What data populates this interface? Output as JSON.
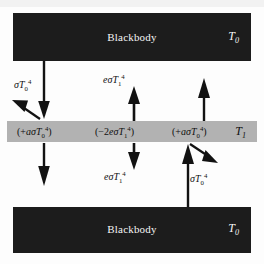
{
  "figure": {
    "type": "physics-diagram",
    "colors": {
      "background": "#fdfdfd",
      "blackbody_plate": "#1c1c1c",
      "blackbody_text": "#f4f4f4",
      "shield_band": "#b2b2b2",
      "shield_text": "#101010",
      "arrow": "#121212"
    }
  },
  "plates": {
    "top": {
      "label": "Blackbody",
      "temperature": "T",
      "temperature_sub": "0"
    },
    "bottom": {
      "label": "Blackbody",
      "temperature": "T",
      "temperature_sub": "0"
    }
  },
  "shield": {
    "temperature": "T",
    "temperature_sub": "1",
    "terms": [
      {
        "name": "absorbed-from-top-plate",
        "open": "(+",
        "coeff": "a",
        "sigma": "σ",
        "symbol": "T",
        "sub": "0",
        "sup": "4",
        "close": ")"
      },
      {
        "name": "emitted-both-sides",
        "open": "(−2",
        "coeff": "e",
        "sigma": "σ",
        "symbol": "T",
        "sub": "1",
        "sup": "4",
        "close": ")"
      },
      {
        "name": "absorbed-from-bottom-plate",
        "open": "(+",
        "coeff": "a",
        "sigma": "σ",
        "symbol": "T",
        "sub": "0",
        "sup": "4",
        "close": ")"
      }
    ]
  },
  "flux_labels": [
    {
      "name": "incident-from-top-plate",
      "coeff": "",
      "sigma": "σ",
      "symbol": "T",
      "sub": "0",
      "sup": "4"
    },
    {
      "name": "shield-emission-upward",
      "coeff": "e",
      "sigma": "σ",
      "symbol": "T",
      "sub": "1",
      "sup": "4"
    },
    {
      "name": "shield-emission-downward",
      "coeff": "e",
      "sigma": "σ",
      "symbol": "T",
      "sub": "1",
      "sup": "4"
    },
    {
      "name": "incident-from-bottom-plate",
      "coeff": "",
      "sigma": "σ",
      "symbol": "T",
      "sub": "0",
      "sup": "4"
    }
  ],
  "arrows": [
    {
      "name": "arrow-down-from-top-plate-left",
      "direction": "down"
    },
    {
      "name": "arrow-reflected-up-left",
      "direction": "up-left"
    },
    {
      "name": "arrow-down-below-shield-left",
      "direction": "down"
    },
    {
      "name": "arrow-up-shield-emission-center",
      "direction": "up"
    },
    {
      "name": "arrow-down-shield-emission-center",
      "direction": "down"
    },
    {
      "name": "arrow-up-right-above-shield",
      "direction": "up"
    },
    {
      "name": "arrow-up-from-bottom-plate-right",
      "direction": "up"
    },
    {
      "name": "arrow-reflected-down-right",
      "direction": "down-right"
    }
  ]
}
